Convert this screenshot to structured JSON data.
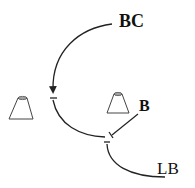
{
  "labels": {
    "bc": "BC",
    "b": "B",
    "lb": "LB"
  },
  "nodes": [
    {
      "id": "left-cone",
      "shape": "trapezoid"
    },
    {
      "id": "right-cone",
      "shape": "trapezoid"
    }
  ],
  "edges": [
    {
      "from": "BC",
      "to": "junction-1",
      "type": "activation-arrow"
    },
    {
      "from": "junction-1",
      "to": "junction-2",
      "type": "inhibition-bar"
    },
    {
      "from": "B",
      "to": "junction-2",
      "type": "inhibition-bar"
    },
    {
      "from": "LB",
      "to": "junction-3",
      "type": "inhibition-bar"
    }
  ],
  "colors": {
    "stroke": "#222222",
    "background": "#ffffff"
  }
}
